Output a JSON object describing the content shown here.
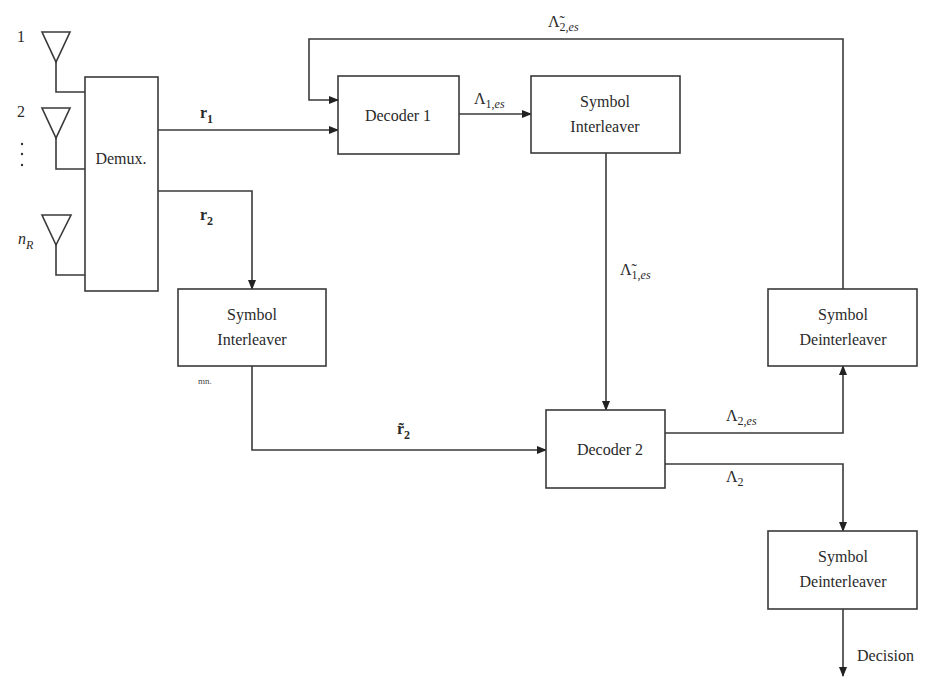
{
  "antennas": [
    {
      "label": "1"
    },
    {
      "label": "2"
    },
    {
      "label": "⋮"
    },
    {
      "label": "n",
      "subscript": "R"
    }
  ],
  "blocks": {
    "demux": {
      "label": "Demux."
    },
    "decoder1": {
      "label": "Decoder 1"
    },
    "interleaver_top": {
      "line1": "Symbol",
      "line2": "Interleaver"
    },
    "interleaver_left": {
      "line1": "Symbol",
      "line2": "Interleaver"
    },
    "decoder2": {
      "label": "Decoder 2"
    },
    "deinterleaver_upper": {
      "line1": "Symbol",
      "line2": "Deinterleaver"
    },
    "deinterleaver_lower": {
      "line1": "Symbol",
      "line2": "Deinterleaver"
    }
  },
  "signals": {
    "r1": {
      "base": "r",
      "sub": "1"
    },
    "r2": {
      "base": "r",
      "sub": "2"
    },
    "r2_tilde": {
      "base": "r̃",
      "sub": "2"
    },
    "lambda_1_es": {
      "base": "Λ",
      "sub_num": "1,",
      "sub_it": "es"
    },
    "lambda_1_es_tilde": {
      "base": "Λ̃",
      "sub_num": "1,",
      "sub_it": "es"
    },
    "lambda_2_es": {
      "base": "Λ",
      "sub_num": "2,",
      "sub_it": "es"
    },
    "lambda_2_es_tilde": {
      "base": "Λ̃",
      "sub_num": "2,",
      "sub_it": "es"
    },
    "lambda_2": {
      "base": "Λ",
      "sub": "2"
    }
  },
  "output": {
    "label": "Decision"
  },
  "annotation": {
    "text": "mn."
  }
}
